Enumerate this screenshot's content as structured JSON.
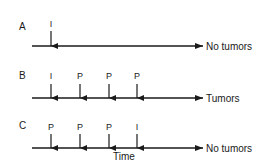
{
  "rows": [
    {
      "label": "A",
      "events": [
        "I"
      ],
      "outcome": "No tumors"
    },
    {
      "label": "B",
      "events": [
        "I",
        "P",
        "P",
        "P"
      ],
      "outcome": "Tumors"
    },
    {
      "label": "C",
      "events": [
        "P",
        "P",
        "P",
        "I"
      ],
      "outcome": "No tumors"
    }
  ],
  "axis_label": "Time",
  "colors": {
    "ink": "#1a1a1a",
    "background": "#ffffff"
  }
}
